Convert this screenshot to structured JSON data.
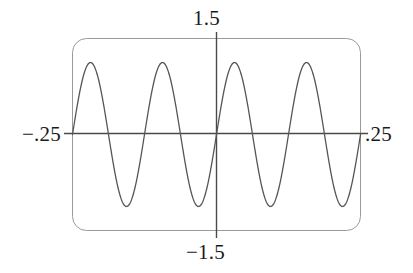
{
  "graph": {
    "labels": {
      "y_max": "1.5",
      "y_min": "−1.5",
      "x_min": "−.25",
      "x_max": ".25"
    },
    "colors": {
      "background": "#ffffff",
      "frame": "#9a9a9a",
      "axis": "#4a4a4a",
      "curve": "#555555",
      "text": "#1a1a1a"
    }
  },
  "chart_data": {
    "type": "line",
    "title": "",
    "xlabel": "",
    "ylabel": "",
    "xlim": [
      -0.25,
      0.25
    ],
    "ylim": [
      -1.5,
      1.5
    ],
    "x_tick_labels": [
      "−.25",
      ".25"
    ],
    "y_tick_labels": [
      "−1.5",
      "1.5"
    ],
    "grid": false,
    "legend": null,
    "axes": {
      "x_axis_at_y": 0,
      "y_axis_at_x": 0,
      "frame": "rounded-rectangle"
    },
    "series": [
      {
        "name": "sine",
        "description": "sinusoid, amplitude 1.125, 4 full cycles across x in [-0.25, 0.25]",
        "amplitude": 1.125,
        "cycles": 4,
        "phase": 0,
        "x": [
          -0.25,
          -0.2344,
          -0.2188,
          -0.2031,
          -0.1875,
          -0.1719,
          -0.1563,
          -0.1406,
          -0.125,
          -0.1094,
          -0.0938,
          -0.0781,
          -0.0625,
          -0.0469,
          -0.0313,
          -0.0156,
          0,
          0.0156,
          0.0313,
          0.0469,
          0.0625,
          0.0781,
          0.0938,
          0.1094,
          0.125,
          0.1406,
          0.1563,
          0.1719,
          0.1875,
          0.2031,
          0.2188,
          0.2344,
          0.25
        ],
        "values": [
          0,
          0.4305,
          0.7955,
          1.0393,
          1.125,
          1.0393,
          0.7955,
          0.4305,
          0,
          -0.4305,
          -0.7955,
          -1.0393,
          -1.125,
          -1.0393,
          -0.7955,
          -0.4305,
          0,
          0.4305,
          0.7955,
          1.0393,
          1.125,
          1.0393,
          0.7955,
          0.4305,
          0,
          -0.4305,
          -0.7955,
          -1.0393,
          -1.125,
          -1.0393,
          -0.7955,
          -0.4305,
          0
        ]
      }
    ]
  }
}
